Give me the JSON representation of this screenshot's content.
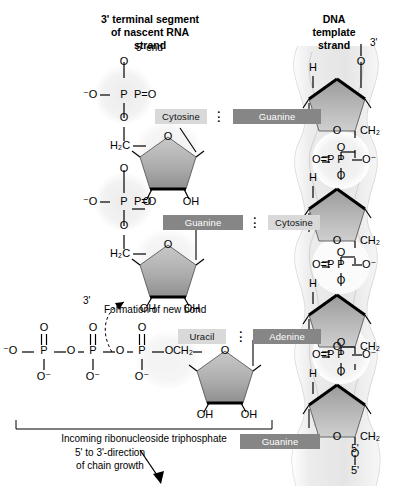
{
  "figure": {
    "type": "biochemistry-diagram"
  },
  "headings": {
    "left_title_line1": "3' terminal segment",
    "left_title_line2": "of nascent RNA",
    "left_title_line3": "strand",
    "right_title_line1": "DNA",
    "right_title_line2": "template",
    "right_title_line3": "strand"
  },
  "end_labels": {
    "rna_5_end": "5' end",
    "dna_3_end": "3'",
    "dna_5_end": "5'",
    "rna_3_oh": "3'"
  },
  "base_pairs": [
    {
      "rna_base": "Cytosine",
      "dna_base": "Guanine",
      "rna_style": "light",
      "dna_style": "dark"
    },
    {
      "rna_base": "Guanine",
      "dna_base": "Cytosine",
      "rna_style": "dark",
      "dna_style": "light"
    },
    {
      "rna_base": "Uracil",
      "dna_base": "Adenine",
      "rna_style": "light",
      "dna_style": "dark"
    }
  ],
  "unpaired_dna_base": {
    "label": "Guanine",
    "style": "dark"
  },
  "annotations": {
    "new_bond": "Formation of new bond",
    "incoming": "Incoming ribonucleoside triphosphate",
    "direction_line1": "5' to 3'-direction",
    "direction_line2": "of chain growth"
  },
  "atoms": {
    "O": "O",
    "P": "P",
    "H": "H",
    "OH": "OH",
    "O_minus_left": "⁻O",
    "O_minus_right": "O⁻",
    "H2C": "H₂C",
    "CH2": "CH₂",
    "P_double_O_right": "P=O",
    "O_double_P": "O=P",
    "O_minus": "O⁻"
  },
  "colors": {
    "base_light": "#d9d9d9",
    "base_dark": "#868686",
    "sugar_fill": "#a8a8a8",
    "halo": "#f0f0f0",
    "backbone_ribbon": "#e3e3e3",
    "bond": "#000000",
    "page_bg": "#ffffff"
  }
}
